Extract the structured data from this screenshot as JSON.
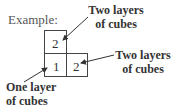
{
  "title": "Example:",
  "grid": {
    "cells": [
      {
        "row": 0,
        "col": 0,
        "value": "2"
      },
      {
        "row": 1,
        "col": 0,
        "value": "1"
      },
      {
        "row": 1,
        "col": 1,
        "value": "2"
      }
    ]
  },
  "annotations": {
    "top_right": {
      "line1": "Two layers",
      "line2": "of cubes"
    },
    "right": {
      "line1": "Two layers",
      "line2": "of cubes"
    },
    "bottom_left": {
      "line1": "One layer",
      "line2": "of cubes"
    }
  }
}
